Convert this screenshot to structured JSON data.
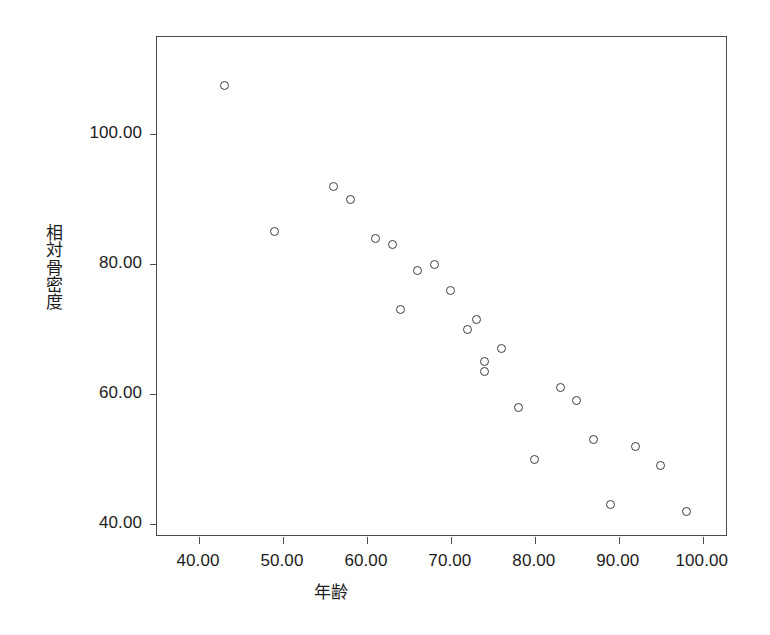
{
  "chart_data": {
    "type": "scatter",
    "title": "",
    "xlabel": "年齢",
    "ylabel": "相対骨密度",
    "xlim": [
      35.0,
      103.0
    ],
    "ylim": [
      38.0,
      115.0
    ],
    "grid": false,
    "legend": null,
    "marker": "open-circle",
    "xticks": [
      40.0,
      50.0,
      60.0,
      70.0,
      80.0,
      90.0,
      100.0
    ],
    "xtick_labels": [
      "40.00",
      "50.00",
      "60.00",
      "70.00",
      "80.00",
      "90.00",
      "100.00"
    ],
    "yticks": [
      40.0,
      60.0,
      80.0,
      100.0
    ],
    "ytick_labels": [
      "40.00",
      "60.00",
      "80.00",
      "100.00"
    ],
    "points": [
      {
        "x": 43,
        "y": 107.5
      },
      {
        "x": 49,
        "y": 85
      },
      {
        "x": 56,
        "y": 92
      },
      {
        "x": 58,
        "y": 90
      },
      {
        "x": 61,
        "y": 84
      },
      {
        "x": 63,
        "y": 83
      },
      {
        "x": 64,
        "y": 73
      },
      {
        "x": 66,
        "y": 79
      },
      {
        "x": 68,
        "y": 80
      },
      {
        "x": 70,
        "y": 76
      },
      {
        "x": 72,
        "y": 70
      },
      {
        "x": 73,
        "y": 71.5
      },
      {
        "x": 74,
        "y": 65
      },
      {
        "x": 74,
        "y": 63.5
      },
      {
        "x": 76,
        "y": 67
      },
      {
        "x": 78,
        "y": 58
      },
      {
        "x": 80,
        "y": 50
      },
      {
        "x": 83,
        "y": 61
      },
      {
        "x": 85,
        "y": 59
      },
      {
        "x": 87,
        "y": 53
      },
      {
        "x": 89,
        "y": 43
      },
      {
        "x": 92,
        "y": 52
      },
      {
        "x": 95,
        "y": 49
      },
      {
        "x": 98,
        "y": 42
      }
    ]
  },
  "axes": {
    "y_title_chars": [
      "相",
      "対",
      "骨",
      "密",
      "度"
    ],
    "x_title": "年齢"
  }
}
